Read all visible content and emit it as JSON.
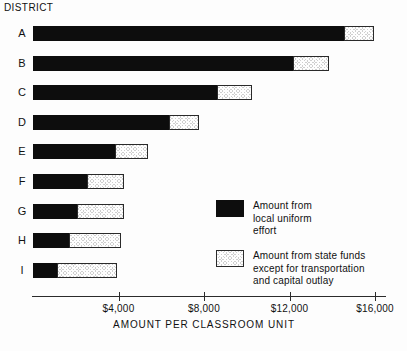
{
  "chart_data": {
    "type": "bar",
    "orientation": "horizontal",
    "stacked": true,
    "title": "",
    "xlabel": "AMOUNT PER CLASSROOM UNIT",
    "ylabel": "DISTRICT",
    "xlim": [
      0,
      16800
    ],
    "xticks": [
      4000,
      8000,
      12000,
      16000
    ],
    "xtick_labels": [
      "$4,000",
      "$8,000",
      "$12,000",
      "$16,000"
    ],
    "grid": false,
    "legend_position": "inside-right",
    "categories": [
      "A",
      "B",
      "C",
      "D",
      "E",
      "F",
      "G",
      "H",
      "I"
    ],
    "series": [
      {
        "name": "Amount from\nlocal uniform\neffort",
        "key": "local",
        "color": "#0d0d0d",
        "fill": "solid-black",
        "values": [
          14600,
          12200,
          8650,
          6400,
          3900,
          2570,
          2100,
          1730,
          1170
        ]
      },
      {
        "name": "Amount from state funds\nexcept for transportation\nand capital outlay",
        "key": "state",
        "color": "#cfcfcf",
        "fill": "cross-hatch",
        "values": [
          1400,
          1700,
          1650,
          1400,
          1550,
          1730,
          2200,
          2430,
          2830
        ]
      }
    ],
    "totals": [
      16000,
      13900,
      10300,
      7800,
      5450,
      4300,
      4300,
      4160,
      4000
    ]
  },
  "axis": {
    "y_axis_title": "DISTRICT",
    "x_axis_title": "AMOUNT PER CLASSROOM UNIT",
    "tick_labels": [
      "$4,000",
      "$8,000",
      "$12,000",
      "$16,000"
    ]
  },
  "rows": [
    {
      "label": "A"
    },
    {
      "label": "B"
    },
    {
      "label": "C"
    },
    {
      "label": "D"
    },
    {
      "label": "E"
    },
    {
      "label": "F"
    },
    {
      "label": "G"
    },
    {
      "label": "H"
    },
    {
      "label": "I"
    }
  ],
  "legend": {
    "items": [
      {
        "swatch": "solid-black",
        "text": "Amount from\nlocal uniform\neffort"
      },
      {
        "swatch": "cross-hatch",
        "text": "Amount from state funds\nexcept for transportation\nand capital outlay"
      }
    ]
  },
  "colors": {
    "local_effort": "#0d0d0d",
    "state_funds": "#cfcfcf",
    "axis": "#2b2b2b",
    "text": "#111111",
    "background": "#fdfdfd"
  }
}
